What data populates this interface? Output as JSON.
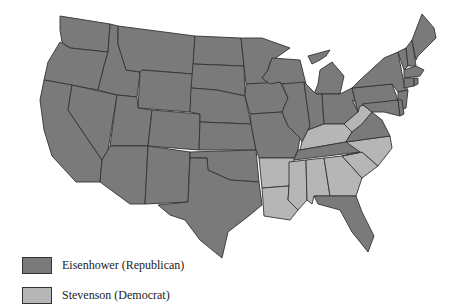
{
  "map": {
    "subject": "U.S. presidential election results by state",
    "colors": {
      "republican": "#7a7a7a",
      "democrat": "#b6b6b6",
      "border": "#333333"
    },
    "states": {
      "WA": "R",
      "OR": "R",
      "CA": "R",
      "NV": "R",
      "ID": "R",
      "MT": "R",
      "WY": "R",
      "UT": "R",
      "AZ": "R",
      "CO": "R",
      "NM": "R",
      "ND": "R",
      "SD": "R",
      "NE": "R",
      "KS": "R",
      "OK": "R",
      "TX": "R",
      "MN": "R",
      "IA": "R",
      "MO": "R",
      "WI": "R",
      "IL": "R",
      "MI": "R",
      "IN": "R",
      "OH": "R",
      "TN": "R",
      "FL": "R",
      "VA": "R",
      "PA": "R",
      "NY": "R",
      "NJ": "R",
      "DE": "R",
      "MD": "R",
      "CT": "R",
      "RI": "R",
      "MA": "R",
      "VT": "R",
      "NH": "R",
      "ME": "R",
      "AR": "D",
      "LA": "D",
      "MS": "D",
      "AL": "D",
      "GA": "D",
      "SC": "D",
      "NC": "D",
      "KY": "D",
      "WV": "D"
    }
  },
  "legend": {
    "items": [
      {
        "label": "Eisenhower (Republican)",
        "color": "#7a7a7a"
      },
      {
        "label": "Stevenson (Democrat)",
        "color": "#b6b6b6"
      }
    ]
  }
}
